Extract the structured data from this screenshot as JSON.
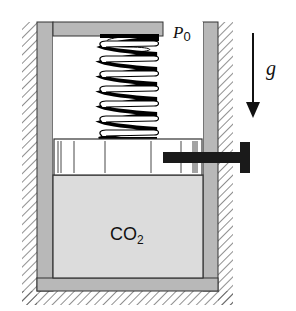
{
  "diagram": {
    "type": "piston-cylinder",
    "labels": {
      "pressure": "P",
      "pressure_sub": "0",
      "gravity": "g",
      "gas": "CO",
      "gas_sub": "2"
    },
    "components": [
      "cylinder",
      "lid",
      "spring",
      "piston",
      "locking-pin",
      "gas-chamber",
      "gravity-arrow"
    ],
    "colors": {
      "wall": "#b8b8b8",
      "gas": "#dcdcdc",
      "outline": "#333333",
      "pin": "#1a1a1a",
      "background": "#ffffff"
    }
  }
}
